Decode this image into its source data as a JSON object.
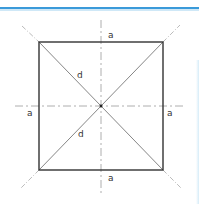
{
  "figure": {
    "type": "square-geometry",
    "colors": {
      "accent_bar": "#3a9ad9",
      "square_stroke": "#333333",
      "diagonal_stroke": "#777777",
      "axis_stroke": "#999999"
    },
    "labels": {
      "side_top": "a",
      "side_bottom": "a",
      "side_left": "a",
      "side_right": "a",
      "diagonal_upper": "d",
      "diagonal_lower": "d"
    }
  }
}
